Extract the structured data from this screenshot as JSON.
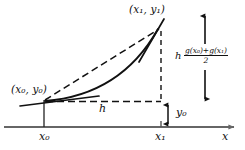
{
  "figure": {
    "type": "trapezoidal-rule-diagram",
    "background_color": "#ffffff",
    "ink_color": "#111111",
    "axis_color": "#666666",
    "labels": {
      "point_upper": "(x₁, y₁)",
      "point_lower": "(x₀, y₀)",
      "tick_left": "x₀",
      "tick_right": "x₁",
      "axis_x": "x",
      "step_width": "h",
      "initial_value": "y₀"
    },
    "formula": {
      "factor": "h",
      "numerator": "g(x₀)+g(x₁)",
      "denominator": "2"
    },
    "elements": {
      "curve": "solid convex curve from (x0,y0) to (x1,y1)",
      "chord": "dashed straight chord from (x0,y0) to (x1,y1)",
      "tangent_lower": "short solid tangent segment at (x0,y0)",
      "tangent_upper": "short solid tangent segment at (x1,y1)",
      "dashed_horizontal": "dashed horizontal segment at level of y0 from x0 to x1",
      "dashed_vertical": "dashed vertical segment at x1 from (x1,y1) down to y0 level",
      "arrow_y0": "double-headed vertical arrow between y0 level and x-axis at x1",
      "arrow_bracket": "tall double-headed vertical arrow at far right spanning the formula",
      "tick_x0": "solid vertical tick at x0 from axis up to (x0,y0)",
      "tick_x1": "tick mark on axis at x1",
      "x_axis": "horizontal gray axis with right arrowhead"
    },
    "geometry": {
      "x0_px": 44,
      "x1_px": 161,
      "y0_level_px": 102,
      "y1_px": 28,
      "axis_y_px": 127,
      "axis_start_px": 4,
      "axis_end_px": 240
    }
  }
}
